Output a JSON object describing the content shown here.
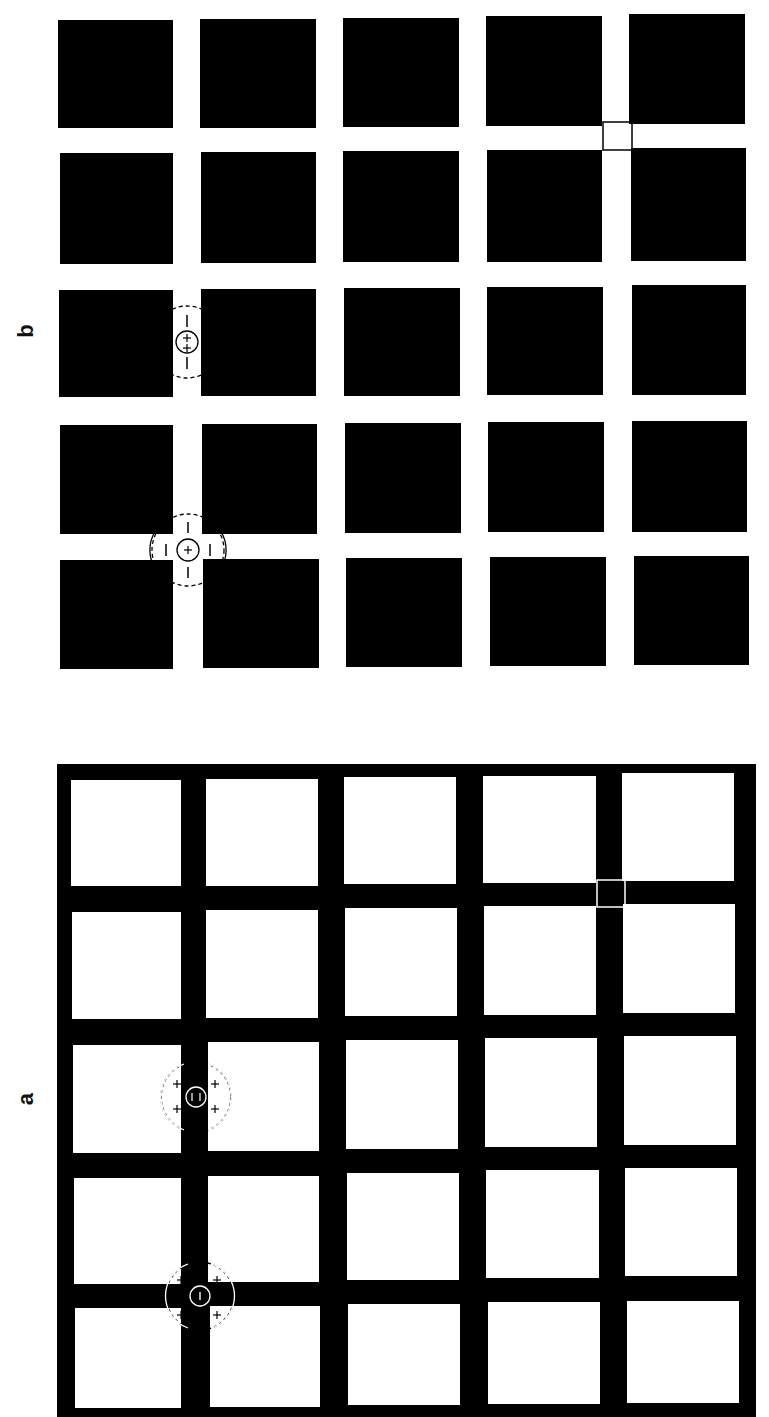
{
  "figure": {
    "orientation": "rotated 90 degrees counter-clockwise",
    "colors": {
      "ink": "#000000",
      "paper": "#ffffff"
    },
    "panels": [
      {
        "id": "b",
        "label": "b",
        "description": "Black squares on white background (white grid lines)",
        "grid": {
          "rows": 5,
          "cols": 5
        },
        "receptive_fields": [
          {
            "location": "intersection",
            "center": "+",
            "surround": [
              "−",
              "−",
              "−",
              "−"
            ],
            "note": "on-center cell at street intersection"
          },
          {
            "location": "street",
            "center": "+ +",
            "surround": [
              "−",
              "−"
            ],
            "note": "on-center cell along street"
          }
        ],
        "highlight": "outlined intersection square"
      },
      {
        "id": "a",
        "label": "a",
        "description": "White squares on black background (black grid lines)",
        "grid": {
          "rows": 5,
          "cols": 5
        },
        "receptive_fields": [
          {
            "location": "intersection",
            "center": "−",
            "surround": [
              "+",
              "+",
              "+",
              "+"
            ],
            "note": "off-center cell at street intersection"
          },
          {
            "location": "street",
            "center": "= (− −)",
            "surround": [
              "+",
              "+",
              "+",
              "+"
            ],
            "note": "off-center cell along street"
          }
        ],
        "highlight": "outlined intersection square"
      }
    ]
  }
}
